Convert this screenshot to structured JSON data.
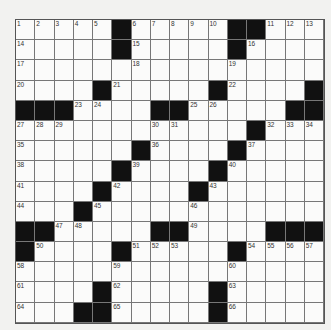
{
  "puzzle": {
    "cols": 16,
    "rows": 15,
    "grid": [
      ".....#.....##...",
      ".....#.....#....",
      "................",
      "....#.....#....#",
      "###....##.....##",
      "............#...",
      "......#....#....",
      ".....#....#.....",
      "....#....#......",
      "...#............",
      "##.....##....###",
      "#....#.....#....",
      "................",
      "....#.....#.....",
      "...##.....#....."
    ],
    "numbers": [
      {
        "r": 0,
        "c": 0,
        "n": 1
      },
      {
        "r": 0,
        "c": 1,
        "n": 2
      },
      {
        "r": 0,
        "c": 2,
        "n": 3
      },
      {
        "r": 0,
        "c": 3,
        "n": 4
      },
      {
        "r": 0,
        "c": 4,
        "n": 5
      },
      {
        "r": 0,
        "c": 6,
        "n": 6
      },
      {
        "r": 0,
        "c": 7,
        "n": 7
      },
      {
        "r": 0,
        "c": 8,
        "n": 8
      },
      {
        "r": 0,
        "c": 9,
        "n": 9
      },
      {
        "r": 0,
        "c": 10,
        "n": 10
      },
      {
        "r": 0,
        "c": 13,
        "n": 11
      },
      {
        "r": 0,
        "c": 14,
        "n": 12
      },
      {
        "r": 0,
        "c": 15,
        "n": 13
      },
      {
        "r": 1,
        "c": 0,
        "n": 14
      },
      {
        "r": 1,
        "c": 6,
        "n": 15
      },
      {
        "r": 1,
        "c": 12,
        "n": 16
      },
      {
        "r": 2,
        "c": 0,
        "n": 17
      },
      {
        "r": 2,
        "c": 6,
        "n": 18
      },
      {
        "r": 2,
        "c": 11,
        "n": 19
      },
      {
        "r": 3,
        "c": 0,
        "n": 20
      },
      {
        "r": 3,
        "c": 5,
        "n": 21
      },
      {
        "r": 3,
        "c": 11,
        "n": 22
      },
      {
        "r": 4,
        "c": 3,
        "n": 23
      },
      {
        "r": 4,
        "c": 4,
        "n": 24
      },
      {
        "r": 4,
        "c": 9,
        "n": 25
      },
      {
        "r": 4,
        "c": 10,
        "n": 26
      },
      {
        "r": 5,
        "c": 0,
        "n": 27
      },
      {
        "r": 5,
        "c": 1,
        "n": 28
      },
      {
        "r": 5,
        "c": 2,
        "n": 29
      },
      {
        "r": 5,
        "c": 7,
        "n": 30
      },
      {
        "r": 5,
        "c": 8,
        "n": 31
      },
      {
        "r": 5,
        "c": 13,
        "n": 32
      },
      {
        "r": 5,
        "c": 14,
        "n": 33
      },
      {
        "r": 5,
        "c": 15,
        "n": 34
      },
      {
        "r": 6,
        "c": 0,
        "n": 35
      },
      {
        "r": 6,
        "c": 7,
        "n": 36
      },
      {
        "r": 6,
        "c": 12,
        "n": 37
      },
      {
        "r": 7,
        "c": 0,
        "n": 38
      },
      {
        "r": 7,
        "c": 6,
        "n": 39
      },
      {
        "r": 7,
        "c": 11,
        "n": 40
      },
      {
        "r": 8,
        "c": 0,
        "n": 41
      },
      {
        "r": 8,
        "c": 5,
        "n": 42
      },
      {
        "r": 8,
        "c": 10,
        "n": 43
      },
      {
        "r": 9,
        "c": 0,
        "n": 44
      },
      {
        "r": 9,
        "c": 4,
        "n": 45
      },
      {
        "r": 9,
        "c": 9,
        "n": 46
      },
      {
        "r": 10,
        "c": 2,
        "n": 47
      },
      {
        "r": 10,
        "c": 3,
        "n": 48
      },
      {
        "r": 10,
        "c": 9,
        "n": 49
      },
      {
        "r": 11,
        "c": 1,
        "n": 50
      },
      {
        "r": 11,
        "c": 6,
        "n": 51
      },
      {
        "r": 11,
        "c": 7,
        "n": 52
      },
      {
        "r": 11,
        "c": 8,
        "n": 53
      },
      {
        "r": 11,
        "c": 12,
        "n": 54
      },
      {
        "r": 11,
        "c": 13,
        "n": 55
      },
      {
        "r": 11,
        "c": 14,
        "n": 56
      },
      {
        "r": 11,
        "c": 15,
        "n": 57
      },
      {
        "r": 12,
        "c": 0,
        "n": 58
      },
      {
        "r": 12,
        "c": 5,
        "n": 59
      },
      {
        "r": 12,
        "c": 11,
        "n": 60
      },
      {
        "r": 13,
        "c": 0,
        "n": 61
      },
      {
        "r": 13,
        "c": 5,
        "n": 62
      },
      {
        "r": 13,
        "c": 11,
        "n": 63
      },
      {
        "r": 14,
        "c": 0,
        "n": 64
      },
      {
        "r": 14,
        "c": 5,
        "n": 65
      },
      {
        "r": 14,
        "c": 11,
        "n": 66
      }
    ]
  }
}
